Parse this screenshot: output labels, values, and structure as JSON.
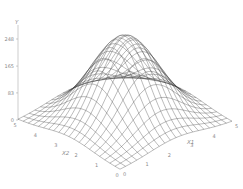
{
  "chart_data": {
    "type": "surface",
    "title": "",
    "function": "gaussian bump",
    "xlabel": "X1",
    "ylabel": "X2",
    "zlabel": "Y",
    "x1_range": [
      0,
      5
    ],
    "x2_range": [
      0,
      5
    ],
    "z_ticks": [
      0,
      83,
      165,
      248
    ],
    "x1_ticks": [
      0,
      1,
      2,
      3,
      4,
      5
    ],
    "x2_ticks": [
      0,
      1,
      2,
      3,
      4,
      5
    ],
    "grid_divisions": 20,
    "peak": {
      "x1": 2.5,
      "x2": 2.5,
      "y": 260
    },
    "sigma": 1.0,
    "colors": {
      "mesh": "#3a3a3a",
      "axis": "#9a9a9a",
      "text": "#8a8a8a"
    }
  }
}
